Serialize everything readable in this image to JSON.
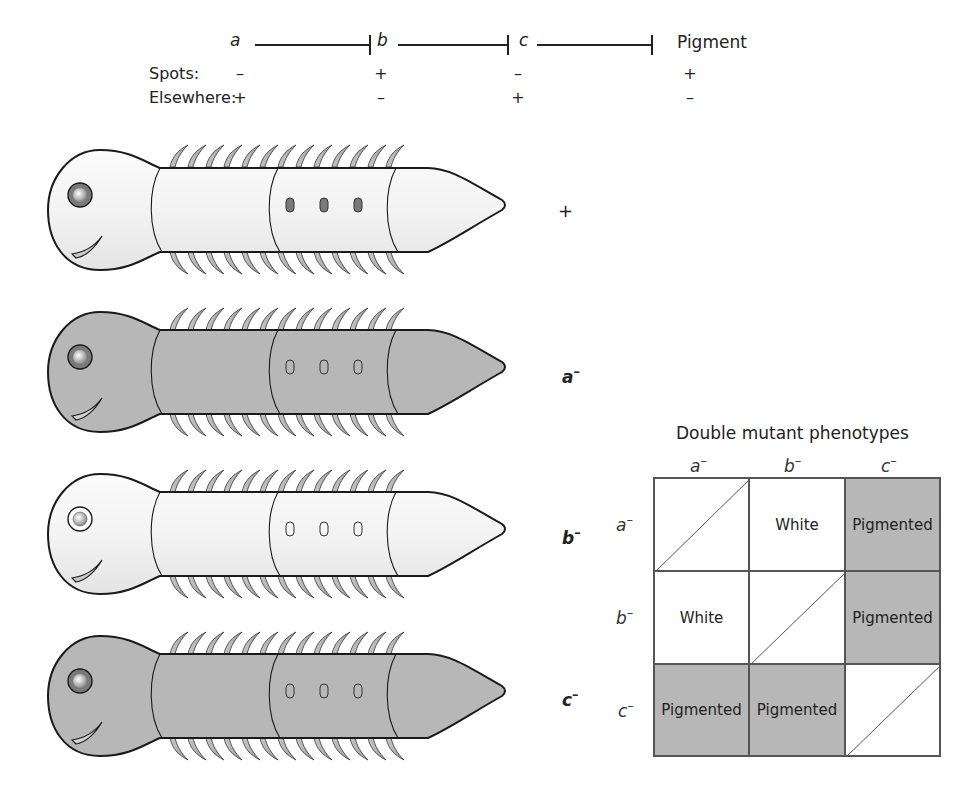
{
  "pathway": {
    "genes": [
      "a",
      "b",
      "c"
    ],
    "product": "Pigment",
    "row_labels": {
      "spots": "Spots:",
      "elsewhere": "Elsewhere:"
    },
    "spots": [
      "–",
      "+",
      "–",
      "+"
    ],
    "elsewhere": [
      "+",
      "–",
      "+",
      "–"
    ]
  },
  "worms": [
    {
      "genotype": "+",
      "superscript": "",
      "body_pigmented": false,
      "spots_pigmented": true,
      "eye_ring_pigmented": true
    },
    {
      "genotype": "a",
      "superscript": "–",
      "body_pigmented": true,
      "spots_pigmented": false,
      "eye_ring_pigmented": true
    },
    {
      "genotype": "b",
      "superscript": "–",
      "body_pigmented": false,
      "spots_pigmented": false,
      "eye_ring_pigmented": false
    },
    {
      "genotype": "c",
      "superscript": "–",
      "body_pigmented": true,
      "spots_pigmented": false,
      "eye_ring_pigmented": true
    }
  ],
  "double_mutant_table": {
    "title": "Double mutant phenotypes",
    "columns": [
      {
        "gene": "a",
        "sup": "–"
      },
      {
        "gene": "b",
        "sup": "–"
      },
      {
        "gene": "c",
        "sup": "–"
      }
    ],
    "rows": [
      {
        "gene": "a",
        "sup": "–"
      },
      {
        "gene": "b",
        "sup": "–"
      },
      {
        "gene": "c",
        "sup": "–"
      }
    ],
    "cells": [
      [
        "",
        "White",
        "Pigmented"
      ],
      [
        "White",
        "",
        "Pigmented"
      ],
      [
        "Pigmented",
        "Pigmented",
        ""
      ]
    ]
  },
  "colors": {
    "pigmented": "#b7b7b7",
    "unpigmented": "#f2f2f2",
    "outline": "#1a1a1a",
    "spot_dark": "#7a7a7a"
  }
}
